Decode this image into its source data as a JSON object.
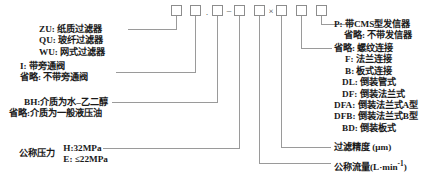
{
  "diagram": {
    "code_boxes": [
      {
        "id": "box1",
        "value": ""
      },
      {
        "id": "box2",
        "value": ""
      },
      {
        "id": "box3",
        "value": ""
      },
      {
        "id": "box4",
        "value": ""
      },
      {
        "id": "box5",
        "value": ""
      },
      {
        "id": "box6",
        "value": ""
      },
      {
        "id": "box7",
        "value": ""
      },
      {
        "id": "box8",
        "value": ""
      },
      {
        "id": "box9",
        "value": ""
      }
    ],
    "separators": [
      {
        "id": "sep-dot",
        "symbol": "·"
      },
      {
        "id": "sep-dash",
        "symbol": "–"
      },
      {
        "id": "sep-times",
        "symbol": "×"
      }
    ],
    "left_labels": {
      "filter_type": {
        "lines": [
          "ZU: 纸质过滤器",
          "QU: 玻纤过滤器",
          "WU: 网式过滤器"
        ]
      },
      "bypass_valve": {
        "lines": [
          "I: 带旁通阀",
          "省略: 不带旁通阀"
        ]
      },
      "medium": {
        "lines": [
          "BH:介质为水–乙二醇",
          "省略:介质为一般液压油"
        ]
      },
      "nominal_pressure": {
        "caption": "公称压力",
        "lines": [
          "H:32MPa",
          "E: ≤22MPa"
        ]
      }
    },
    "right_labels": {
      "transmitter": {
        "lines": [
          "P:  带CMS型发信器",
          "省略:  不带发信器"
        ]
      },
      "connection": {
        "lines": [
          "省略:  螺纹连接",
          "F:  法兰连接",
          "B:  板式连接",
          "DL: 倒装管式",
          "DF: 倒装法兰式",
          "DFA:  倒装法兰式A型",
          "DFB:  倒装法兰式B型",
          "BD:  倒装板式"
        ]
      },
      "filtration_accuracy": {
        "text": "过滤精度 (μm)"
      },
      "nominal_flow": {
        "text_main": "公称流量(L·min",
        "text_sup": "-1",
        "text_tail": ")"
      }
    },
    "colors": {
      "line": "#9a9a9a",
      "box_border": "#8d8d8d",
      "text": "#161616",
      "background": "#ffffff"
    }
  }
}
